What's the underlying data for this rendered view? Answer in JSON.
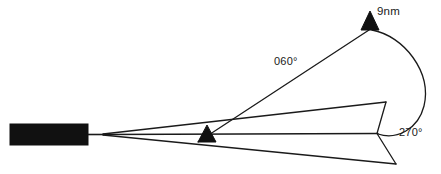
{
  "diagram": {
    "type": "aviation-approach-geometry",
    "background_color": "#ffffff",
    "stroke_color": "#1a1a1a",
    "fill_color": "#111111",
    "labels": {
      "distance": "9nm",
      "inbound_track": "060°",
      "outbound_track": "270°"
    },
    "markers": {
      "holding_fix_name": "9nm-aircraft-marker",
      "aircraft_name": "aircraft-marker"
    },
    "runway": {
      "name": "runway-block"
    },
    "geometry": {
      "runway_rect": {
        "x": 10,
        "y": 124,
        "width": 78,
        "height": 21
      },
      "converge_point": {
        "x": 103,
        "y": 134
      },
      "aircraft_triangle": {
        "cx": 207,
        "cy": 141,
        "half_width": 9,
        "height": 16
      },
      "fix_triangle": {
        "cx": 370,
        "cy": 29,
        "half_width": 9,
        "height": 18
      },
      "chevron_vertex": {
        "x": 377,
        "y": 133
      },
      "upper_ray_end": {
        "x": 386,
        "y": 102
      },
      "lower_ray_end": {
        "x": 396,
        "y": 164
      },
      "center_ray_end": {
        "x": 377,
        "y": 133
      }
    }
  }
}
